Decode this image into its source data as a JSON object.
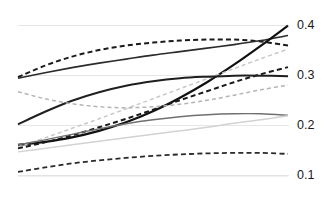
{
  "chart_data": {
    "type": "line",
    "title": "",
    "subtitle": "",
    "xlabel": "",
    "ylabel": "",
    "xlim": [
      0,
      1
    ],
    "ylim": [
      0.06,
      0.427
    ],
    "grid": true,
    "grid_axis": "y",
    "legend": "none",
    "x_ticks_visible": false,
    "y_axis_position": "right",
    "y_tick_labels": [
      "0.4",
      "0.3",
      "0.2",
      "0.1"
    ],
    "y_tick_values": [
      0.4,
      0.3,
      0.2,
      0.1
    ],
    "x": [
      0,
      0.1,
      0.2,
      0.3,
      0.4,
      0.5,
      0.6,
      0.7,
      0.8,
      0.9,
      1
    ],
    "series": [
      {
        "name": "series-1",
        "style": "dashed",
        "color": "#1a1a1a",
        "width": 2.0,
        "values": [
          0.297,
          0.32,
          0.338,
          0.351,
          0.36,
          0.366,
          0.37,
          0.372,
          0.372,
          0.368,
          0.36
        ]
      },
      {
        "name": "series-2",
        "style": "solid",
        "color": "#2b2b2b",
        "width": 1.6,
        "values": [
          0.295,
          0.306,
          0.316,
          0.325,
          0.333,
          0.341,
          0.348,
          0.355,
          0.362,
          0.37,
          0.38
        ]
      },
      {
        "name": "series-3",
        "style": "solid",
        "color": "#111111",
        "width": 2.2,
        "values": [
          0.162,
          0.168,
          0.177,
          0.19,
          0.207,
          0.229,
          0.256,
          0.287,
          0.322,
          0.36,
          0.4
        ]
      },
      {
        "name": "series-4",
        "style": "dashed",
        "color": "#c8c8c8",
        "width": 1.5,
        "values": [
          0.158,
          0.176,
          0.195,
          0.214,
          0.234,
          0.254,
          0.274,
          0.294,
          0.314,
          0.334,
          0.353
        ]
      },
      {
        "name": "series-5",
        "style": "dashed",
        "color": "#1a1a1a",
        "width": 2.0,
        "values": [
          0.155,
          0.167,
          0.181,
          0.197,
          0.214,
          0.232,
          0.251,
          0.269,
          0.287,
          0.303,
          0.317
        ]
      },
      {
        "name": "series-6",
        "style": "solid",
        "color": "#1f1f1f",
        "width": 2.0,
        "values": [
          0.203,
          0.228,
          0.25,
          0.267,
          0.28,
          0.289,
          0.295,
          0.298,
          0.3,
          0.3,
          0.299
        ]
      },
      {
        "name": "series-7",
        "style": "dashed",
        "color": "#b4b4b4",
        "width": 1.5,
        "values": [
          0.268,
          0.254,
          0.244,
          0.238,
          0.236,
          0.238,
          0.243,
          0.251,
          0.261,
          0.272,
          0.281
        ]
      },
      {
        "name": "series-8",
        "style": "solid",
        "color": "#707070",
        "width": 1.4,
        "values": [
          0.162,
          0.172,
          0.183,
          0.194,
          0.204,
          0.212,
          0.218,
          0.222,
          0.224,
          0.224,
          0.221
        ]
      },
      {
        "name": "series-9",
        "style": "solid",
        "color": "#d2d2d2",
        "width": 1.5,
        "values": [
          0.148,
          0.155,
          0.162,
          0.169,
          0.176,
          0.183,
          0.19,
          0.197,
          0.205,
          0.212,
          0.22
        ]
      },
      {
        "name": "series-10",
        "style": "dashed",
        "color": "#2a2a2a",
        "width": 1.8,
        "values": [
          0.108,
          0.117,
          0.125,
          0.131,
          0.136,
          0.14,
          0.143,
          0.145,
          0.146,
          0.146,
          0.144
        ]
      },
      {
        "name": "series-11",
        "style": "solid",
        "color": "#e2e2e2",
        "width": 1.3,
        "values": [
          0.1,
          0.1,
          0.1,
          0.1,
          0.1,
          0.1,
          0.1,
          0.1,
          0.1,
          0.1,
          0.1
        ]
      }
    ],
    "gridline_color": "#e6e6e6",
    "background_color": "#ffffff",
    "label_color": "#1a1a1a"
  },
  "axis": {
    "ticks": [
      {
        "label": "0.4",
        "value": 0.4
      },
      {
        "label": "0.3",
        "value": 0.3
      },
      {
        "label": "0.2",
        "value": 0.2
      },
      {
        "label": "0.1",
        "value": 0.1
      }
    ]
  },
  "header": {
    "title": ""
  }
}
